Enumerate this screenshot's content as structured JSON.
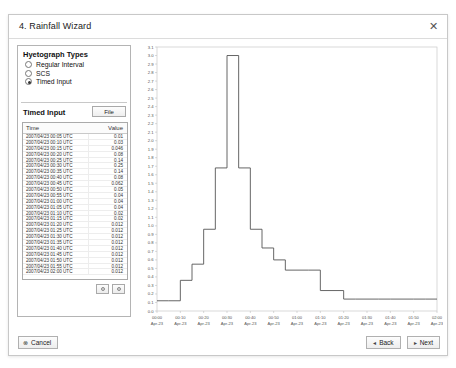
{
  "dialog": {
    "title": "4. Rainfall Wizard",
    "close_icon": "close-icon",
    "close_glyph": "✕"
  },
  "left_panel": {
    "hyetograph_heading": "Hyetograph Types",
    "options": [
      {
        "label": "Regular Interval",
        "selected": false
      },
      {
        "label": "SCS",
        "selected": false
      },
      {
        "label": "Timed Input",
        "selected": true
      }
    ],
    "timed_input_label": "Timed Input",
    "file_button": "File",
    "add_button_icon": "circle-add-icon",
    "remove_button_icon": "circle-remove-icon"
  },
  "table": {
    "columns": [
      "Time",
      "Value"
    ],
    "rows": [
      {
        "time": "2007/04/23 00:05 UTC",
        "value": "0.01"
      },
      {
        "time": "2007/04/23 00:10 UTC",
        "value": "0.03"
      },
      {
        "time": "2007/04/23 00:15 UTC",
        "value": "0.046"
      },
      {
        "time": "2007/04/23 00:20 UTC",
        "value": "0.08"
      },
      {
        "time": "2007/04/23 00:25 UTC",
        "value": "0.14"
      },
      {
        "time": "2007/04/23 00:30 UTC",
        "value": "0.25"
      },
      {
        "time": "2007/04/23 00:35 UTC",
        "value": "0.14"
      },
      {
        "time": "2007/04/23 00:40 UTC",
        "value": "0.08"
      },
      {
        "time": "2007/04/23 00:45 UTC",
        "value": "0.062"
      },
      {
        "time": "2007/04/23 00:50 UTC",
        "value": "0.05"
      },
      {
        "time": "2007/04/23 00:55 UTC",
        "value": "0.04"
      },
      {
        "time": "2007/04/23 01:00 UTC",
        "value": "0.04"
      },
      {
        "time": "2007/04/23 01:05 UTC",
        "value": "0.04"
      },
      {
        "time": "2007/04/23 01:10 UTC",
        "value": "0.02"
      },
      {
        "time": "2007/04/23 01:15 UTC",
        "value": "0.02"
      },
      {
        "time": "2007/04/23 01:20 UTC",
        "value": "0.012"
      },
      {
        "time": "2007/04/23 01:25 UTC",
        "value": "0.012"
      },
      {
        "time": "2007/04/23 01:30 UTC",
        "value": "0.012"
      },
      {
        "time": "2007/04/23 01:35 UTC",
        "value": "0.012"
      },
      {
        "time": "2007/04/23 01:40 UTC",
        "value": "0.012"
      },
      {
        "time": "2007/04/23 01:45 UTC",
        "value": "0.012"
      },
      {
        "time": "2007/04/23 01:50 UTC",
        "value": "0.012"
      },
      {
        "time": "2007/04/23 01:55 UTC",
        "value": "0.012"
      },
      {
        "time": "2007/04/23 02:00 UTC",
        "value": "0.012"
      }
    ]
  },
  "footer": {
    "cancel_label": "Cancel",
    "cancel_icon": "cancel-circle-icon",
    "cancel_glyph": "⊗",
    "back_label": "Back",
    "back_glyph": "◂",
    "next_label": "Next",
    "next_glyph": "▸"
  },
  "chart_data": {
    "type": "line",
    "title": "",
    "xlabel": "",
    "ylabel": "",
    "ylim": [
      0.0,
      3.1
    ],
    "xlim": [
      "00:00",
      "02:00"
    ],
    "grid": false,
    "step": "post",
    "ytick_labels": [
      "3.1",
      "3.0",
      "2.9",
      "2.8",
      "2.7",
      "2.6",
      "2.5",
      "2.4",
      "2.3",
      "2.2",
      "2.1",
      "2.0",
      "1.9",
      "1.8",
      "1.7",
      "1.6",
      "1.5",
      "1.4",
      "1.3",
      "1.2",
      "1.1",
      "1.0",
      "0.9",
      "0.8",
      "0.7",
      "0.6",
      "0.5",
      "0.4",
      "0.3",
      "0.2",
      "0.1",
      "0.0"
    ],
    "ytick_values": [
      3.1,
      3.0,
      2.9,
      2.8,
      2.7,
      2.6,
      2.5,
      2.4,
      2.3,
      2.2,
      2.1,
      2.0,
      1.9,
      1.8,
      1.7,
      1.6,
      1.5,
      1.4,
      1.3,
      1.2,
      1.1,
      1.0,
      0.9,
      0.8,
      0.7,
      0.6,
      0.5,
      0.4,
      0.3,
      0.2,
      0.1,
      0.0
    ],
    "xtick_labels": [
      "00:00",
      "00:10",
      "00:20",
      "00:30",
      "00:40",
      "00:50",
      "01:00",
      "01:10",
      "01:20",
      "01:30",
      "01:40",
      "01:50",
      "02:00"
    ],
    "xtick_sublabels": [
      "Apr-23",
      "Apr-23",
      "Apr-23",
      "Apr-23",
      "Apr-23",
      "Apr-23",
      "Apr-23",
      "Apr-23",
      "Apr-23",
      "Apr-23",
      "Apr-23",
      "Apr-23",
      "Apr-23"
    ],
    "x_minutes": [
      0,
      5,
      10,
      15,
      20,
      25,
      30,
      35,
      40,
      45,
      50,
      55,
      60,
      65,
      70,
      75,
      80,
      85,
      90,
      95,
      100,
      105,
      110,
      115,
      120
    ],
    "series": [
      {
        "name": "Rainfall intensity",
        "color": "#555555",
        "x": [
          0,
          5,
          10,
          15,
          20,
          25,
          30,
          35,
          40,
          45,
          50,
          55,
          60,
          65,
          70,
          75,
          80,
          85,
          90,
          95,
          100,
          105,
          110,
          115,
          120
        ],
        "values": [
          0.12,
          0.12,
          0.36,
          0.55,
          0.96,
          1.68,
          3.0,
          1.68,
          0.96,
          0.74,
          0.6,
          0.48,
          0.48,
          0.48,
          0.24,
          0.24,
          0.14,
          0.14,
          0.14,
          0.14,
          0.14,
          0.14,
          0.14,
          0.14,
          0.14
        ]
      }
    ]
  }
}
